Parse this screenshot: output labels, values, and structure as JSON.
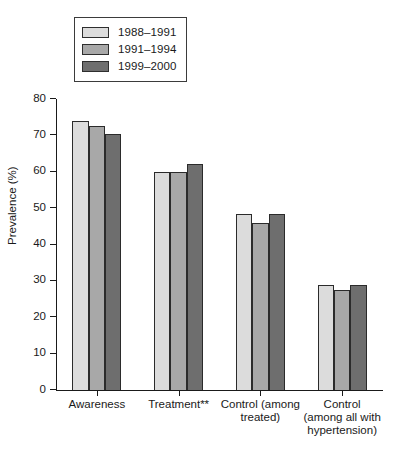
{
  "chart_data": {
    "type": "bar",
    "title": "",
    "xlabel": "",
    "ylabel": "Prevalence (%)",
    "ylim": [
      0,
      80
    ],
    "yticks": [
      0,
      10,
      20,
      30,
      40,
      50,
      60,
      70,
      80
    ],
    "grid": false,
    "legend_position": "top-left",
    "categories": [
      "Awareness",
      "Treatment**",
      "Control (among\ntreated)",
      "Control\n(among all with\nhypertension)"
    ],
    "series": [
      {
        "name": "1988–1991",
        "color": "#dcdcdc",
        "values": [
          74.0,
          60.0,
          48.5,
          29.0
        ]
      },
      {
        "name": "1991–1994",
        "color": "#a8a8a8",
        "values": [
          72.5,
          60.0,
          45.8,
          27.5
        ]
      },
      {
        "name": "1999–2000",
        "color": "#6e6e6e",
        "values": [
          70.5,
          62.0,
          48.5,
          29.0
        ]
      }
    ]
  }
}
